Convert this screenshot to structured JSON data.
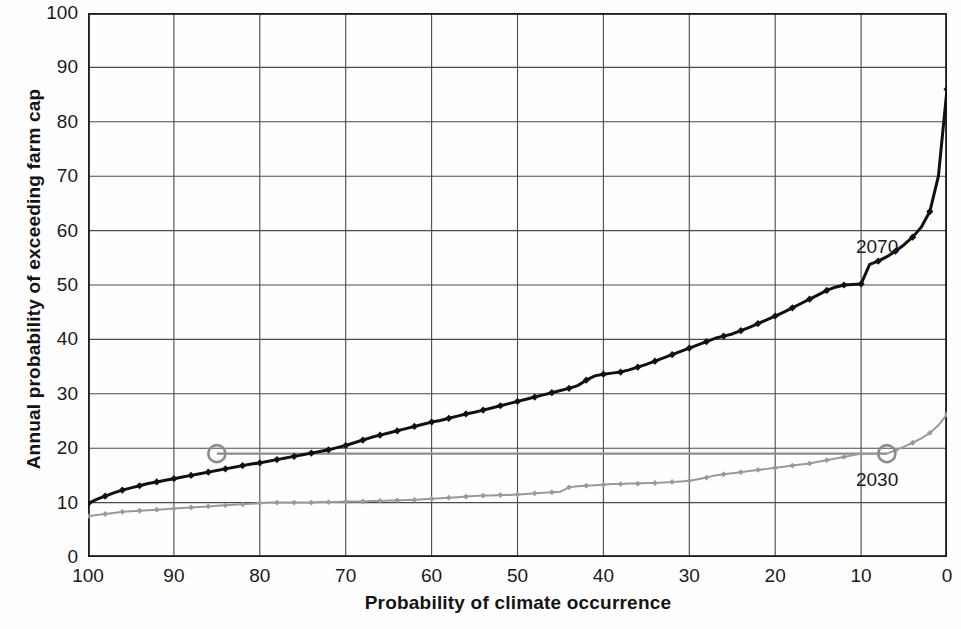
{
  "chart_data": {
    "type": "line",
    "title": "",
    "xlabel": "Probability of climate occurrence",
    "ylabel": "Annual probability of exceeding farm cap",
    "xlim": [
      100,
      0
    ],
    "ylim": [
      0,
      100
    ],
    "x_reversed": true,
    "grid": true,
    "legend_position": "inline-labels",
    "x_ticks": [
      "100",
      "90",
      "80",
      "70",
      "60",
      "50",
      "40",
      "30",
      "20",
      "10",
      "0"
    ],
    "y_ticks": [
      "0",
      "10",
      "20",
      "30",
      "40",
      "50",
      "60",
      "70",
      "80",
      "90",
      "100"
    ],
    "annotations": [
      {
        "label": "2070",
        "x": 8.5,
        "y": 57,
        "series": "2070"
      },
      {
        "label": "2030",
        "x": 8.5,
        "y": 14.2,
        "series": "2030"
      }
    ],
    "highlight_points": [
      {
        "series": "2070",
        "x": 85,
        "y": 19.0,
        "marker": "circle"
      },
      {
        "series": "2030",
        "x": 7,
        "y": 19.0,
        "marker": "circle"
      }
    ],
    "reference_line": {
      "y": 19.0,
      "x_from": 85,
      "x_to": 7,
      "color": "#8c8c8c"
    },
    "series": [
      {
        "name": "2070",
        "color": "#111111",
        "marker": "diamond",
        "x": [
          100,
          99,
          98,
          97,
          96,
          95,
          94,
          93,
          92,
          91,
          90,
          89,
          88,
          87,
          86,
          85,
          84,
          83,
          82,
          81,
          80,
          79,
          78,
          77,
          76,
          75,
          74,
          73,
          72,
          71,
          70,
          69,
          68,
          67,
          66,
          65,
          64,
          63,
          62,
          61,
          60,
          59,
          58,
          57,
          56,
          55,
          54,
          53,
          52,
          51,
          50,
          49,
          48,
          47,
          46,
          45,
          44,
          43,
          42,
          41,
          40,
          39,
          38,
          37,
          36,
          35,
          34,
          33,
          32,
          31,
          30,
          29,
          28,
          27,
          26,
          25,
          24,
          23,
          22,
          21,
          20,
          19,
          18,
          17,
          16,
          15,
          14,
          13,
          12,
          11,
          10,
          9,
          8,
          7,
          6,
          5,
          4,
          3,
          2,
          1,
          0
        ],
        "y": [
          9.8,
          10.6,
          11.2,
          11.8,
          12.3,
          12.7,
          13.1,
          13.5,
          13.8,
          14.1,
          14.4,
          14.7,
          15.0,
          15.3,
          15.6,
          15.9,
          16.2,
          16.5,
          16.8,
          17.1,
          17.3,
          17.6,
          17.9,
          18.2,
          18.5,
          18.8,
          19.1,
          19.4,
          19.7,
          20.1,
          20.5,
          21.0,
          21.5,
          22.0,
          22.4,
          22.8,
          23.2,
          23.6,
          24.0,
          24.4,
          24.8,
          25.1,
          25.5,
          25.9,
          26.3,
          26.6,
          27.0,
          27.4,
          27.8,
          28.2,
          28.6,
          29.0,
          29.4,
          29.8,
          30.2,
          30.6,
          31.0,
          31.5,
          32.5,
          33.3,
          33.6,
          33.8,
          34.0,
          34.4,
          34.9,
          35.4,
          36.0,
          36.6,
          37.2,
          37.8,
          38.4,
          39.0,
          39.6,
          40.2,
          40.6,
          41.0,
          41.6,
          42.2,
          42.9,
          43.6,
          44.3,
          45.0,
          45.8,
          46.6,
          47.4,
          48.2,
          49.0,
          49.6,
          50.0,
          50.1,
          50.2,
          53.8,
          54.4,
          55.2,
          56.2,
          57.4,
          58.8,
          60.6,
          63.5,
          70.0,
          86.0
        ]
      },
      {
        "name": "2030",
        "color": "#9a9a9a",
        "marker": "diamond",
        "x": [
          100,
          99,
          98,
          97,
          96,
          95,
          94,
          93,
          92,
          91,
          90,
          89,
          88,
          87,
          86,
          85,
          84,
          83,
          82,
          81,
          80,
          79,
          78,
          77,
          76,
          75,
          74,
          73,
          72,
          71,
          70,
          69,
          68,
          67,
          66,
          65,
          64,
          63,
          62,
          61,
          60,
          59,
          58,
          57,
          56,
          55,
          54,
          53,
          52,
          51,
          50,
          49,
          48,
          47,
          46,
          45,
          44,
          43,
          42,
          41,
          40,
          39,
          38,
          37,
          36,
          35,
          34,
          33,
          32,
          31,
          30,
          29,
          28,
          27,
          26,
          25,
          24,
          23,
          22,
          21,
          20,
          19,
          18,
          17,
          16,
          15,
          14,
          13,
          12,
          11,
          10,
          9,
          8,
          7,
          6,
          5,
          4,
          3,
          2,
          1,
          0
        ],
        "y": [
          7.5,
          7.7,
          7.9,
          8.1,
          8.3,
          8.4,
          8.5,
          8.6,
          8.7,
          8.8,
          8.9,
          9.0,
          9.1,
          9.2,
          9.3,
          9.4,
          9.5,
          9.6,
          9.7,
          9.8,
          9.9,
          10.0,
          10.0,
          10.0,
          10.0,
          10.0,
          10.0,
          10.1,
          10.1,
          10.1,
          10.2,
          10.2,
          10.2,
          10.3,
          10.3,
          10.4,
          10.4,
          10.5,
          10.5,
          10.6,
          10.7,
          10.8,
          10.9,
          11.0,
          11.1,
          11.2,
          11.3,
          11.3,
          11.4,
          11.4,
          11.5,
          11.6,
          11.7,
          11.8,
          11.9,
          12.0,
          12.8,
          13.0,
          13.1,
          13.2,
          13.3,
          13.4,
          13.4,
          13.5,
          13.5,
          13.6,
          13.6,
          13.7,
          13.8,
          13.9,
          14.0,
          14.3,
          14.6,
          15.0,
          15.2,
          15.4,
          15.6,
          15.8,
          16.0,
          16.2,
          16.4,
          16.6,
          16.8,
          17.0,
          17.2,
          17.5,
          17.8,
          18.1,
          18.4,
          18.7,
          19.0,
          19.0,
          19.0,
          19.0,
          19.6,
          20.3,
          21.0,
          21.8,
          22.8,
          24.2,
          26.2
        ]
      }
    ]
  }
}
